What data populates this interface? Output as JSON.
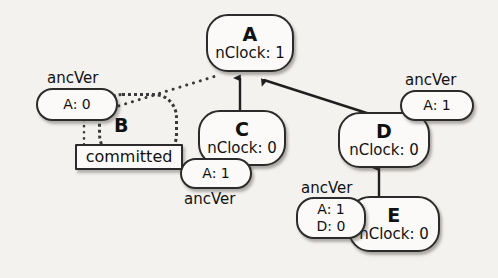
{
  "diagram": {
    "background_color": "#f4f2ef",
    "stroke_color": "#2b2b2b",
    "node_fill": "#fbfaf8",
    "labels": {
      "ancver": "ancVer",
      "committed": "committed"
    },
    "nodes": [
      {
        "id": "A",
        "clock": "nClock: 1"
      },
      {
        "id": "C",
        "clock": "nClock: 0"
      },
      {
        "id": "D",
        "clock": "nClock: 0"
      },
      {
        "id": "E",
        "clock": "nClock: 0"
      }
    ],
    "dotted_nodes": [
      {
        "id": "B"
      }
    ],
    "ancver_badges": [
      {
        "owner": "B",
        "label": "ancVer",
        "line1": "A: 0",
        "line2": ""
      },
      {
        "owner": "C",
        "label": "ancVer",
        "line1": "A: 1",
        "line2": ""
      },
      {
        "owner": "D",
        "label": "ancVer",
        "line1": "A: 1",
        "line2": ""
      },
      {
        "owner": "E",
        "label": "ancVer",
        "line1": "A: 1",
        "line2": "D: 0"
      }
    ],
    "boxes": [
      {
        "owner": "B",
        "text": "committed"
      }
    ],
    "edges": [
      {
        "from": "C",
        "to": "A",
        "style": "solid",
        "arrow": true
      },
      {
        "from": "D",
        "to": "A",
        "style": "solid",
        "arrow": true
      },
      {
        "from": "E",
        "to": "D",
        "style": "solid",
        "arrow": true
      },
      {
        "from": "B",
        "to": "A",
        "style": "dotted",
        "arrow": false
      },
      {
        "from": "ancVer-A0",
        "to": "committed",
        "style": "dotted",
        "arrow": false
      }
    ]
  }
}
